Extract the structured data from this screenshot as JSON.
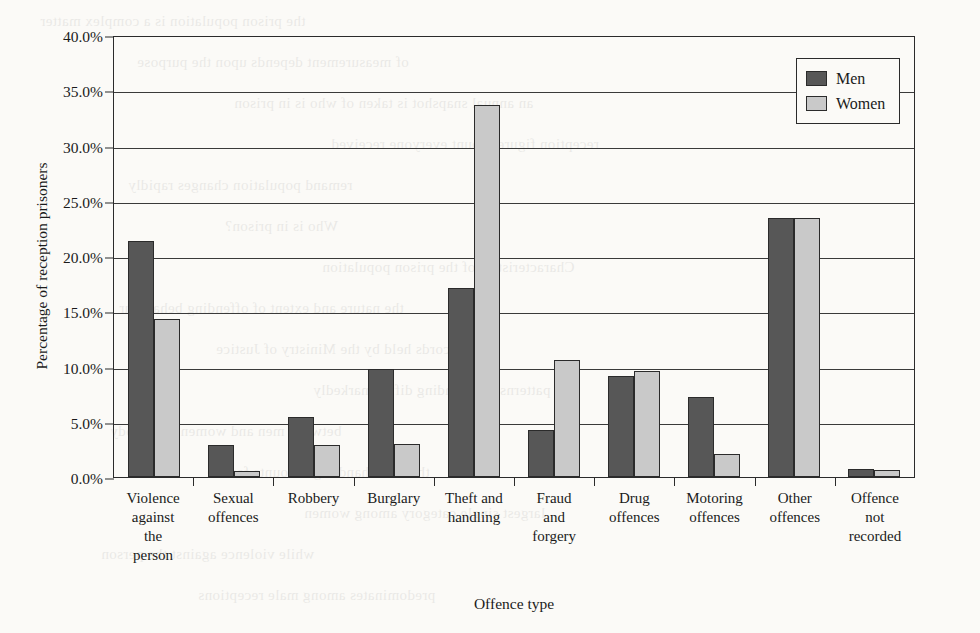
{
  "chart_data": {
    "type": "bar",
    "title": "",
    "xlabel": "Offence type",
    "ylabel": "Percentage of reception prisoners",
    "ylim": [
      0,
      40
    ],
    "ytick_step": 5,
    "ytick_labels": [
      "0.0%",
      "5.0%",
      "10.0%",
      "15.0%",
      "20.0%",
      "25.0%",
      "30.0%",
      "35.0%",
      "40.0%"
    ],
    "grid": true,
    "legend_position": "top-right",
    "value_suffix": "%",
    "categories": [
      "Violence against the person",
      "Sexual offences",
      "Robbery",
      "Burglary",
      "Theft and handling",
      "Fraud and forgery",
      "Drug offences",
      "Motoring offences",
      "Other offences",
      "Offence not recorded"
    ],
    "category_lines": [
      [
        "Violence",
        "against",
        "the",
        "person"
      ],
      [
        "Sexual",
        "offences"
      ],
      [
        "Robbery"
      ],
      [
        "Burglary"
      ],
      [
        "Theft and",
        "handling"
      ],
      [
        "Fraud",
        "and",
        "forgery"
      ],
      [
        "Drug",
        "offences"
      ],
      [
        "Motoring",
        "offences"
      ],
      [
        "Other",
        "offences"
      ],
      [
        "Offence",
        "not",
        "recorded"
      ]
    ],
    "series": [
      {
        "name": "Men",
        "color": "#575757",
        "values": [
          21.4,
          2.9,
          5.4,
          9.8,
          17.1,
          4.3,
          9.1,
          7.2,
          23.4,
          0.7
        ]
      },
      {
        "name": "Women",
        "color": "#c9c9c9",
        "values": [
          14.3,
          0.5,
          2.9,
          3.0,
          33.7,
          10.6,
          9.6,
          2.1,
          23.4,
          0.6
        ]
      }
    ]
  },
  "legend": {
    "entries": [
      {
        "label": "Men"
      },
      {
        "label": "Women"
      }
    ]
  },
  "bleed_text": [
    "the prison population is a complex matter",
    "of measurement depends upon the purpose",
    "an annual snapshot is taken of who is in prison",
    "reception figures count everyone received",
    "remand population changes rapidly",
    "Who is in prison?",
    "Characteristics of the prison population",
    "the nature and extent of offending behaviour",
    "records held by the Ministry of Justice",
    "patterns of offending differ markedly",
    "between men and women in custody",
    "theft and handling accounts for the",
    "largest single category among women",
    "while violence against the person",
    "predominates among male receptions"
  ]
}
